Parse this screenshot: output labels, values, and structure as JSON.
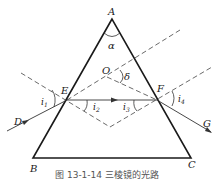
{
  "figure": {
    "caption": "图 13-1-14  三棱镜的光路",
    "labels": {
      "A": "A",
      "B": "B",
      "C": "C",
      "D": "D",
      "E": "E",
      "F": "F",
      "G": "G",
      "O": "O",
      "alpha": "α",
      "delta": "δ",
      "i1": "i",
      "i1_sub": "1",
      "i2": "i",
      "i2_sub": "2",
      "i3": "i",
      "i3_sub": "3",
      "i4": "i",
      "i4_sub": "4"
    },
    "colors": {
      "line": "#1a1a1a",
      "ray": "#333333",
      "dashed": "#444444"
    }
  }
}
